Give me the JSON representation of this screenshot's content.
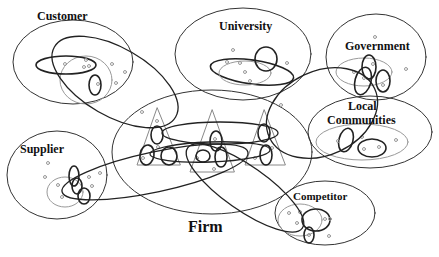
{
  "diagram": {
    "type": "network-ellipses",
    "colors": {
      "stroke_dark": "#222222",
      "stroke_light": "#888888",
      "node": "#999999",
      "background": "#ffffff"
    },
    "central": {
      "label": "Firm"
    },
    "actors": [
      {
        "id": "customer",
        "label": "Customer"
      },
      {
        "id": "university",
        "label": "University"
      },
      {
        "id": "government",
        "label": "Government"
      },
      {
        "id": "local_communities",
        "label_line1": "Local",
        "label_line2": "Communities"
      },
      {
        "id": "supplier",
        "label": "Supplier"
      },
      {
        "id": "competitor",
        "label": "Competitor"
      }
    ],
    "firm_units": {
      "count": 3,
      "shape": "triangle"
    }
  }
}
